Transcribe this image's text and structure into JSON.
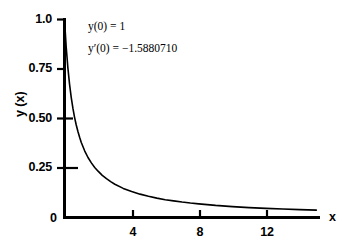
{
  "figure": {
    "background_color": "#ffffff",
    "ink_color": "#000000"
  },
  "annotations": {
    "initial_value": "y(0) = 1",
    "initial_slope": "y′(0) = −1.5880710"
  },
  "axes": {
    "y_title": "y (x)",
    "x_title": "x",
    "origin_label": "0",
    "y_ticks": [
      "1.0",
      "0.75",
      "0.50",
      "0.25"
    ],
    "x_ticks": [
      "4",
      "8",
      "12"
    ]
  },
  "chart_data": {
    "type": "line",
    "title": "",
    "subtitle": "",
    "xlabel": "x",
    "ylabel": "y (x)",
    "xlim": [
      0,
      15.1
    ],
    "ylim": [
      0,
      1.0
    ],
    "xticks": [
      4,
      8,
      12
    ],
    "xticklabels": [
      "4",
      "8",
      "12"
    ],
    "yticks": [
      0.25,
      0.5,
      0.75,
      1.0
    ],
    "yticklabels": [
      "0.25",
      "0.50",
      "0.75",
      "1.0"
    ],
    "grid": false,
    "legend": false,
    "legend_position": "none",
    "annotations": [
      {
        "text": "y(0) = 1",
        "x": 1.2,
        "y": 0.94
      },
      {
        "text": "y′(0) = −1.5880710",
        "x": 1.2,
        "y": 0.84
      }
    ],
    "series": [
      {
        "name": "y(x)",
        "color": "#000000",
        "linewidth": 1.6,
        "x": [
          0.0,
          0.1,
          0.2,
          0.3,
          0.4,
          0.5,
          0.6,
          0.7,
          0.8,
          0.9,
          1.0,
          1.2,
          1.4,
          1.6,
          1.8,
          2.0,
          2.25,
          2.5,
          2.75,
          3.0,
          3.5,
          4.0,
          4.5,
          5.0,
          5.5,
          6.0,
          6.5,
          7.0,
          7.5,
          8.0,
          9.0,
          10.0,
          11.0,
          12.0,
          13.0,
          14.0,
          15.0
        ],
        "y": [
          1.0,
          0.862,
          0.757,
          0.674,
          0.607,
          0.552,
          0.506,
          0.467,
          0.434,
          0.405,
          0.379,
          0.337,
          0.303,
          0.276,
          0.253,
          0.234,
          0.213,
          0.196,
          0.181,
          0.168,
          0.147,
          0.131,
          0.118,
          0.107,
          0.098,
          0.09,
          0.084,
          0.078,
          0.073,
          0.069,
          0.061,
          0.055,
          0.05,
          0.046,
          0.043,
          0.04,
          0.037
        ]
      }
    ],
    "notes": {
      "initial_value": 1,
      "initial_slope": -1.588071,
      "behavior": "monotonically decreasing, convex, asymptotic to y = 0"
    }
  }
}
